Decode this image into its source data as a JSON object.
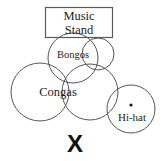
{
  "diagram": {
    "title_box": {
      "name": "music-stand",
      "line1": "Music",
      "line2": "Stand",
      "shape": "rectangle",
      "x": 45,
      "y": 7,
      "width": 68,
      "height": 31,
      "stroke_color": "#5a5a5a"
    },
    "labels": {
      "bongos": "Bongos",
      "congas": "Congas",
      "hihat": "Hi-hat",
      "x_mark": "X"
    },
    "circles": [
      {
        "name": "bongo-left",
        "cx": 73,
        "cy": 58,
        "r": 25
      },
      {
        "name": "bongo-right",
        "cx": 98,
        "cy": 54,
        "r": 16
      },
      {
        "name": "conga-left",
        "cx": 40,
        "cy": 92,
        "r": 29
      },
      {
        "name": "conga-right",
        "cx": 90,
        "cy": 92,
        "r": 28
      },
      {
        "name": "hihat",
        "cx": 131,
        "cy": 109,
        "r": 24
      }
    ],
    "center_dot": {
      "name": "hihat-center-dot",
      "cx": 131,
      "cy": 105,
      "r": 1.6,
      "color": "#1a1a1a"
    },
    "stroke_color": "#555555",
    "background_color": "#ffffff",
    "canvas": {
      "width": 162,
      "height": 161
    }
  }
}
